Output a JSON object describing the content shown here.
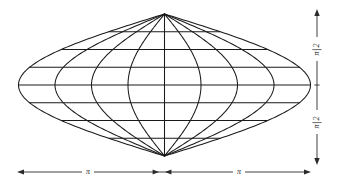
{
  "figure": {
    "name": "map-projection-graticule",
    "background_color": "#ffffff",
    "line_color": "#1a1a1a",
    "axis_color": "#2a2a2a"
  },
  "axes": {
    "vertical": {
      "name": "vertical-axis",
      "upper_label": "π/2",
      "lower_label": "π/2",
      "numerator": "π",
      "denominator": "2",
      "orientation": "rotated-90"
    },
    "horizontal": {
      "name": "horizontal-axis",
      "left_label": "π",
      "right_label": "π"
    }
  },
  "chart_data": {
    "type": "line",
    "title": "",
    "xlabel": "",
    "ylabel": "",
    "xlim": [
      -3.14159,
      3.14159
    ],
    "ylim": [
      -1.5708,
      1.5708
    ],
    "x_tick_labels": [
      "π",
      "π"
    ],
    "y_tick_labels": [
      "π/2",
      "π/2"
    ],
    "grid": false,
    "legend": "none",
    "projection": "sinusoidal",
    "meridian_longitudes_deg": [
      -180,
      -135,
      -90,
      -45,
      0,
      45,
      90,
      135,
      180
    ],
    "parallel_latitudes_deg": [
      -67.5,
      -45,
      -22.5,
      0,
      22.5,
      45,
      67.5
    ],
    "meridian_count": 9,
    "parallel_count": 7,
    "pole_north_deg": 90,
    "pole_south_deg": -90
  }
}
